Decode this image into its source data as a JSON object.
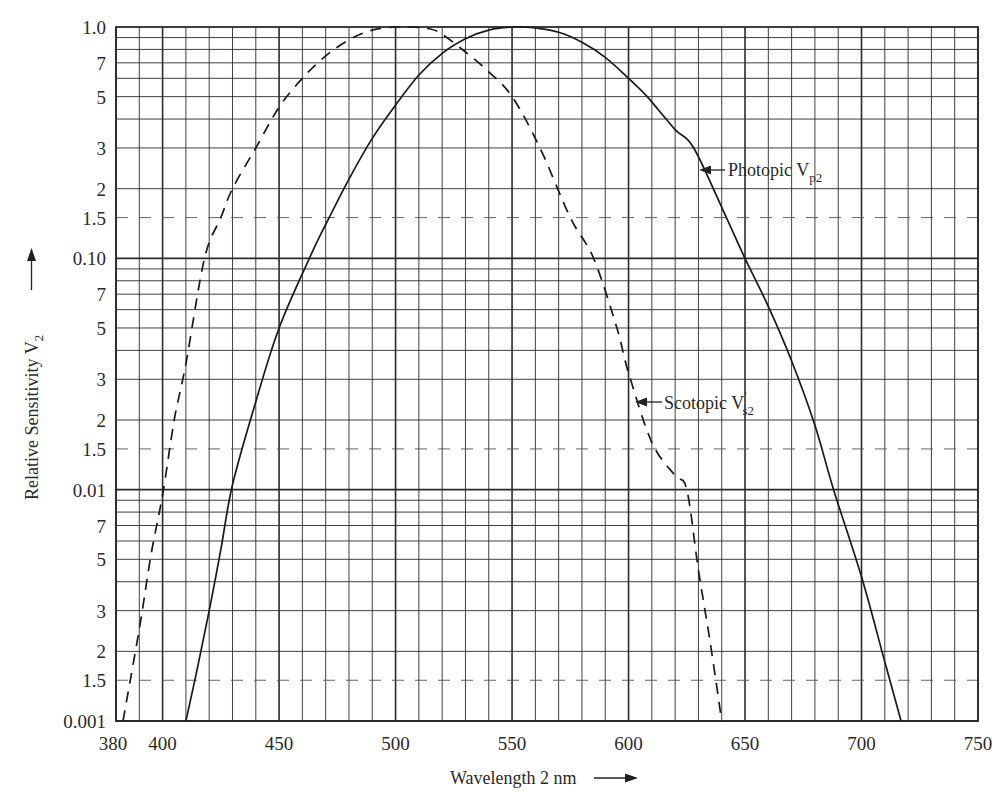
{
  "chart_data": {
    "type": "line",
    "title": "",
    "xlabel": "Wavelength 2 nm",
    "ylabel": "Relative Sensitivity V2",
    "xlim": [
      380,
      750
    ],
    "ylim": [
      0.001,
      1.0
    ],
    "yscale": "log",
    "grid": true,
    "x_ticks": [
      380,
      400,
      450,
      500,
      550,
      600,
      650,
      700,
      750
    ],
    "x_minor_step": 10,
    "y_tick_labels": [
      {
        "value": 1.0,
        "label": "1.0"
      },
      {
        "value": 0.7,
        "label": "7"
      },
      {
        "value": 0.5,
        "label": "5"
      },
      {
        "value": 0.3,
        "label": "3"
      },
      {
        "value": 0.2,
        "label": "2"
      },
      {
        "value": 0.15,
        "label": "1.5"
      },
      {
        "value": 0.1,
        "label": "0.10"
      },
      {
        "value": 0.07,
        "label": "7"
      },
      {
        "value": 0.05,
        "label": "5"
      },
      {
        "value": 0.03,
        "label": "3"
      },
      {
        "value": 0.02,
        "label": "2"
      },
      {
        "value": 0.015,
        "label": "1.5"
      },
      {
        "value": 0.01,
        "label": "0.01"
      },
      {
        "value": 0.007,
        "label": "7"
      },
      {
        "value": 0.005,
        "label": "5"
      },
      {
        "value": 0.003,
        "label": "3"
      },
      {
        "value": 0.002,
        "label": "2"
      },
      {
        "value": 0.0015,
        "label": "1.5"
      },
      {
        "value": 0.001,
        "label": "0.001"
      }
    ],
    "series": [
      {
        "name": "Photopic Vp2",
        "style": "solid",
        "x": [
          410,
          415,
          420,
          425,
          430,
          440,
          450,
          463,
          470,
          480,
          490,
          500,
          510,
          520,
          530,
          540,
          550,
          555,
          560,
          570,
          580,
          590,
          600,
          608,
          620,
          628,
          642,
          650,
          660,
          670,
          680,
          688,
          700,
          710,
          717
        ],
        "values": [
          0.001,
          0.0017,
          0.003,
          0.0055,
          0.0105,
          0.024,
          0.05,
          0.1,
          0.14,
          0.22,
          0.33,
          0.46,
          0.62,
          0.77,
          0.89,
          0.97,
          1.0,
          1.0,
          0.99,
          0.95,
          0.86,
          0.74,
          0.6,
          0.5,
          0.36,
          0.3,
          0.15,
          0.1,
          0.062,
          0.036,
          0.019,
          0.01,
          0.0042,
          0.0018,
          0.001
        ]
      },
      {
        "name": "Scotopic V's2",
        "style": "dashed",
        "x": [
          383,
          390,
          395,
          400,
          405,
          410,
          418,
          425,
          430,
          440,
          450,
          460,
          470,
          480,
          490,
          500,
          507,
          515,
          520,
          530,
          540,
          550,
          562,
          575,
          585,
          595,
          600,
          610,
          620,
          625,
          630,
          635,
          640
        ],
        "values": [
          0.001,
          0.0025,
          0.0052,
          0.0095,
          0.02,
          0.035,
          0.1,
          0.15,
          0.2,
          0.3,
          0.45,
          0.6,
          0.75,
          0.88,
          0.97,
          1.0,
          1.0,
          0.98,
          0.93,
          0.78,
          0.64,
          0.5,
          0.3,
          0.15,
          0.1,
          0.05,
          0.032,
          0.016,
          0.0115,
          0.01,
          0.0045,
          0.0022,
          0.001
        ]
      }
    ],
    "annotations": [
      {
        "text": "Photopic V",
        "sub": "p2",
        "at_x": 628,
        "at_y": 0.3
      },
      {
        "text": "Scotopic V",
        "sup": "'",
        "sub": "s2",
        "at_x": 602,
        "at_y": 0.028
      }
    ]
  },
  "labels": {
    "xlabel_text": "Wavelength  2 nm",
    "ylabel_text": "Relative  Sensitivity  V",
    "ylabel_sub": "2",
    "photopic_text": "Photopic V",
    "photopic_sub": "p2",
    "scotopic_text": "Scotopic  V",
    "scotopic_sup": "'",
    "scotopic_sub": "s2"
  }
}
